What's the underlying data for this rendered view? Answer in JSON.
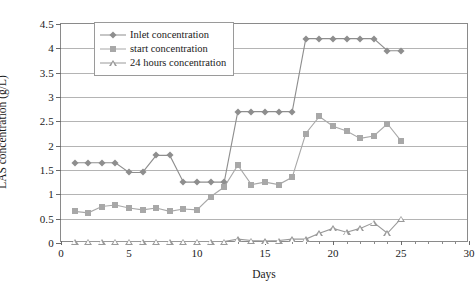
{
  "chart_data": {
    "type": "line",
    "title": "",
    "xlabel": "Days",
    "ylabel": "LAS concentration (g/L)",
    "xlim": [
      0,
      30
    ],
    "ylim": [
      0,
      4.5
    ],
    "xticks": [
      0,
      5,
      10,
      15,
      20,
      25,
      30
    ],
    "xtick_labels": [
      "0",
      "5",
      "10",
      "15",
      "20",
      "25",
      "30"
    ],
    "xtick_minor_step": 1,
    "yticks": [
      0,
      0.5,
      1,
      1.5,
      2,
      2.5,
      3,
      3.5,
      4,
      4.5
    ],
    "ytick_labels": [
      "0",
      "0.5",
      "1",
      "1.5",
      "2",
      "2.5",
      "3",
      "3.5",
      "4",
      "4.5"
    ],
    "grid": "horizontal",
    "legend_position": "top-left-inside",
    "series": [
      {
        "name": "Inlet concentration",
        "marker": "diamond",
        "color": "#8e8e8e",
        "x": [
          1,
          2,
          3,
          4,
          5,
          6,
          7,
          8,
          9,
          10,
          11,
          12,
          13,
          14,
          15,
          16,
          17,
          18,
          19,
          20,
          21,
          22,
          23,
          24,
          25
        ],
        "y": [
          1.65,
          1.65,
          1.65,
          1.65,
          1.45,
          1.45,
          1.8,
          1.8,
          1.25,
          1.25,
          1.25,
          1.25,
          2.7,
          2.7,
          2.7,
          2.7,
          2.7,
          4.2,
          4.2,
          4.2,
          4.2,
          4.2,
          4.2,
          3.95,
          3.95
        ]
      },
      {
        "name": "start concentration",
        "marker": "square",
        "color": "#a8a8a8",
        "x": [
          1,
          2,
          3,
          4,
          5,
          6,
          7,
          8,
          9,
          10,
          11,
          12,
          13,
          14,
          15,
          16,
          17,
          18,
          19,
          20,
          21,
          22,
          23,
          24,
          25
        ],
        "y": [
          0.65,
          0.62,
          0.75,
          0.78,
          0.72,
          0.68,
          0.72,
          0.65,
          0.7,
          0.68,
          0.95,
          1.15,
          1.6,
          1.2,
          1.25,
          1.2,
          1.35,
          2.25,
          2.6,
          2.4,
          2.3,
          2.15,
          2.2,
          2.45,
          2.1
        ]
      },
      {
        "name": "24 hours concentration",
        "marker": "open-triangle",
        "color": "#9a9a9a",
        "x": [
          1,
          2,
          3,
          4,
          5,
          6,
          7,
          8,
          9,
          10,
          11,
          12,
          13,
          14,
          15,
          16,
          17,
          18,
          19,
          20,
          21,
          22,
          23,
          24,
          25
        ],
        "y": [
          0.03,
          0.03,
          0.03,
          0.03,
          0.03,
          0.03,
          0.03,
          0.03,
          0.03,
          0.03,
          0.03,
          0.03,
          0.08,
          0.05,
          0.04,
          0.05,
          0.08,
          0.08,
          0.2,
          0.3,
          0.22,
          0.3,
          0.42,
          0.2,
          0.5
        ]
      }
    ]
  }
}
